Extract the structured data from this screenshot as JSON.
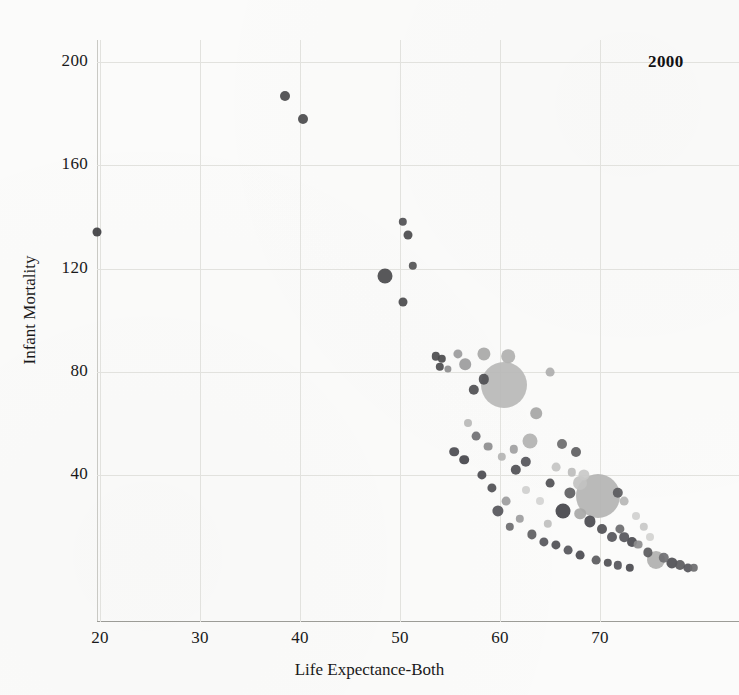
{
  "chart_data": {
    "type": "scatter",
    "title": "",
    "annotation": "2000",
    "xlabel": "Life Expectance-Both",
    "ylabel": "Infant Mortality",
    "xticks": [
      20,
      30,
      40,
      50,
      60,
      70
    ],
    "yticks": [
      40,
      80,
      120,
      160,
      200
    ],
    "xlim": [
      19.7,
      79.9
    ],
    "ylim": [
      0,
      213
    ],
    "grid": true,
    "legend": null,
    "bubble_size_meaning": "population",
    "colors": {
      "dark_bubble": "#4a4a4c",
      "mid_bubble": "#8d8d8e",
      "light_bubble": "#b9b9b8",
      "pale_bubble": "#d4d4d2",
      "gridline": "#e2e2de",
      "axis": "#9c9c97",
      "text": "#19191a",
      "background": "#fbfbfa"
    },
    "points": [
      {
        "x": 19.7,
        "y": 134,
        "r": 4.5,
        "c": "#3f3f42"
      },
      {
        "x": 38.5,
        "y": 187,
        "r": 5.0,
        "c": "#4a4a4c"
      },
      {
        "x": 40.3,
        "y": 178,
        "r": 5.0,
        "c": "#4a4a4c"
      },
      {
        "x": 50.3,
        "y": 138,
        "r": 4.2,
        "c": "#4f4f52"
      },
      {
        "x": 50.8,
        "y": 133,
        "r": 4.5,
        "c": "#4a4a4c"
      },
      {
        "x": 51.3,
        "y": 121,
        "r": 4.2,
        "c": "#525254"
      },
      {
        "x": 48.5,
        "y": 117,
        "r": 7.5,
        "c": "#4a4a4c"
      },
      {
        "x": 50.3,
        "y": 107,
        "r": 4.5,
        "c": "#4a4a4c"
      },
      {
        "x": 53.6,
        "y": 86,
        "r": 4.2,
        "c": "#4b4b4d"
      },
      {
        "x": 54.2,
        "y": 85,
        "r": 4.2,
        "c": "#4b4b4d"
      },
      {
        "x": 54.0,
        "y": 82,
        "r": 4.2,
        "c": "#4b4b4d"
      },
      {
        "x": 54.8,
        "y": 81,
        "r": 3.6,
        "c": "#8d8d8e"
      },
      {
        "x": 55.8,
        "y": 87,
        "r": 4.6,
        "c": "#9b9b9c"
      },
      {
        "x": 56.5,
        "y": 83,
        "r": 5.8,
        "c": "#9b9b9c"
      },
      {
        "x": 58.4,
        "y": 87,
        "r": 6.6,
        "c": "#a8a8a7"
      },
      {
        "x": 60.8,
        "y": 86,
        "r": 6.8,
        "c": "#b0b0af"
      },
      {
        "x": 60.4,
        "y": 75,
        "r": 23.0,
        "c": "#b8b8b7"
      },
      {
        "x": 58.4,
        "y": 77,
        "r": 5.2,
        "c": "#4f4f52"
      },
      {
        "x": 57.4,
        "y": 73,
        "r": 5.2,
        "c": "#4f4f52"
      },
      {
        "x": 65.0,
        "y": 80,
        "r": 4.4,
        "c": "#aeaeae"
      },
      {
        "x": 63.6,
        "y": 64,
        "r": 5.8,
        "c": "#a6a6a5"
      },
      {
        "x": 63.0,
        "y": 53,
        "r": 7.5,
        "c": "#b2b2b1"
      },
      {
        "x": 66.2,
        "y": 52,
        "r": 5.0,
        "c": "#6b6b6d"
      },
      {
        "x": 67.6,
        "y": 49,
        "r": 5.0,
        "c": "#5e5e61"
      },
      {
        "x": 62.6,
        "y": 45,
        "r": 5.2,
        "c": "#55555a"
      },
      {
        "x": 61.6,
        "y": 42,
        "r": 5.2,
        "c": "#4f4f54"
      },
      {
        "x": 65.6,
        "y": 43,
        "r": 4.4,
        "c": "#c4c4c3"
      },
      {
        "x": 67.2,
        "y": 41,
        "r": 4.2,
        "c": "#bdbdbc"
      },
      {
        "x": 68.4,
        "y": 40,
        "r": 5.6,
        "c": "#c9c9c8"
      },
      {
        "x": 68.0,
        "y": 37,
        "r": 7.0,
        "c": "#c2c2c1"
      },
      {
        "x": 65.0,
        "y": 37,
        "r": 4.4,
        "c": "#4f4f52"
      },
      {
        "x": 69.8,
        "y": 32,
        "r": 22.0,
        "c": "#b4b4b3"
      },
      {
        "x": 67.0,
        "y": 33,
        "r": 5.6,
        "c": "#5e5e61"
      },
      {
        "x": 71.8,
        "y": 33,
        "r": 5.2,
        "c": "#5a5a5d"
      },
      {
        "x": 72.4,
        "y": 30,
        "r": 4.4,
        "c": "#b6b6b5"
      },
      {
        "x": 66.3,
        "y": 26,
        "r": 7.5,
        "c": "#44444a"
      },
      {
        "x": 68.0,
        "y": 25,
        "r": 5.8,
        "c": "#a8a8a7"
      },
      {
        "x": 69.0,
        "y": 22,
        "r": 5.6,
        "c": "#4a4a4f"
      },
      {
        "x": 70.2,
        "y": 19,
        "r": 5.0,
        "c": "#4f4f54"
      },
      {
        "x": 71.2,
        "y": 16,
        "r": 5.0,
        "c": "#55555a"
      },
      {
        "x": 72.4,
        "y": 16,
        "r": 4.8,
        "c": "#55555a"
      },
      {
        "x": 73.2,
        "y": 14,
        "r": 5.0,
        "c": "#4a4a4f"
      },
      {
        "x": 72.0,
        "y": 19,
        "r": 4.6,
        "c": "#6b6b6e"
      },
      {
        "x": 73.8,
        "y": 13,
        "r": 4.4,
        "c": "#8d8d8e"
      },
      {
        "x": 74.8,
        "y": 10,
        "r": 4.6,
        "c": "#5a5a5d"
      },
      {
        "x": 75.6,
        "y": 7,
        "r": 9.0,
        "c": "#b0b0af"
      },
      {
        "x": 76.4,
        "y": 8,
        "r": 5.2,
        "c": "#6f6f72"
      },
      {
        "x": 77.2,
        "y": 6,
        "r": 5.6,
        "c": "#4f4f54"
      },
      {
        "x": 78.0,
        "y": 5,
        "r": 5.0,
        "c": "#5a5a5d"
      },
      {
        "x": 78.8,
        "y": 4,
        "r": 4.6,
        "c": "#55555a"
      },
      {
        "x": 79.4,
        "y": 4,
        "r": 4.2,
        "c": "#6b6b6e"
      },
      {
        "x": 75.0,
        "y": 16,
        "r": 4.0,
        "c": "#d2d2d0"
      },
      {
        "x": 73.6,
        "y": 24,
        "r": 4.0,
        "c": "#d0d0cf"
      },
      {
        "x": 74.4,
        "y": 20,
        "r": 4.2,
        "c": "#c8c8c7"
      },
      {
        "x": 64.0,
        "y": 30,
        "r": 4.0,
        "c": "#d4d4d2"
      },
      {
        "x": 62.6,
        "y": 34,
        "r": 4.0,
        "c": "#cfcfce"
      },
      {
        "x": 64.8,
        "y": 21,
        "r": 4.2,
        "c": "#bfbfbe"
      },
      {
        "x": 62.0,
        "y": 23,
        "r": 4.2,
        "c": "#9d9d9e"
      },
      {
        "x": 63.2,
        "y": 17,
        "r": 4.6,
        "c": "#5e5e61"
      },
      {
        "x": 64.4,
        "y": 14,
        "r": 4.6,
        "c": "#55555a"
      },
      {
        "x": 65.6,
        "y": 13,
        "r": 4.6,
        "c": "#4f4f54"
      },
      {
        "x": 66.8,
        "y": 11,
        "r": 4.4,
        "c": "#55555a"
      },
      {
        "x": 68.0,
        "y": 9,
        "r": 4.4,
        "c": "#4a4a4f"
      },
      {
        "x": 61.0,
        "y": 20,
        "r": 4.2,
        "c": "#6b6b6e"
      },
      {
        "x": 59.8,
        "y": 26,
        "r": 5.6,
        "c": "#55555a"
      },
      {
        "x": 60.6,
        "y": 30,
        "r": 4.4,
        "c": "#9c9c9d"
      },
      {
        "x": 59.2,
        "y": 35,
        "r": 4.6,
        "c": "#4f4f54"
      },
      {
        "x": 58.2,
        "y": 40,
        "r": 4.6,
        "c": "#4a4a4f"
      },
      {
        "x": 56.4,
        "y": 46,
        "r": 4.8,
        "c": "#44444a"
      },
      {
        "x": 55.4,
        "y": 49,
        "r": 4.8,
        "c": "#4a4a4f"
      },
      {
        "x": 57.6,
        "y": 55,
        "r": 4.4,
        "c": "#6f6f72"
      },
      {
        "x": 58.8,
        "y": 51,
        "r": 4.4,
        "c": "#8d8d8e"
      },
      {
        "x": 60.2,
        "y": 47,
        "r": 4.2,
        "c": "#b4b4b3"
      },
      {
        "x": 61.4,
        "y": 50,
        "r": 4.2,
        "c": "#a0a0a1"
      },
      {
        "x": 56.8,
        "y": 60,
        "r": 4.0,
        "c": "#b8b8b7"
      },
      {
        "x": 69.6,
        "y": 7,
        "r": 4.4,
        "c": "#5a5a5d"
      },
      {
        "x": 70.8,
        "y": 6,
        "r": 4.2,
        "c": "#4f4f54"
      },
      {
        "x": 71.8,
        "y": 5,
        "r": 4.2,
        "c": "#55555a"
      },
      {
        "x": 73.0,
        "y": 4,
        "r": 4.2,
        "c": "#4a4a4f"
      }
    ]
  }
}
